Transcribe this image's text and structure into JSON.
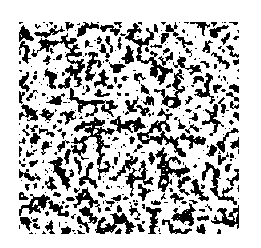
{
  "image": {
    "description": "Binarized random two-phase texture (black speckles on white)",
    "background_color": "#ffffff",
    "foreground_color": "#000000",
    "region": {
      "x": 19,
      "y": 22,
      "width": 220,
      "height": 212
    },
    "black_fraction": 0.42,
    "seed": 1337
  }
}
